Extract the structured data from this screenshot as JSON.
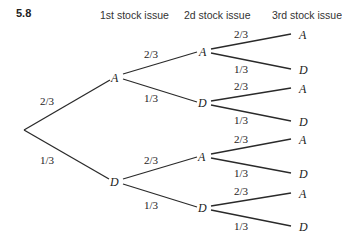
{
  "figure": {
    "problem_number": "5.8",
    "column_headers": [
      "1st stock issue",
      "2d stock issue",
      "3rd stock issue"
    ]
  },
  "tree": {
    "root": {
      "label": ""
    },
    "level1": [
      {
        "label": "A",
        "prob": "2/3"
      },
      {
        "label": "D",
        "prob": "1/3"
      }
    ],
    "level2": [
      {
        "label": "A",
        "prob": "2/3",
        "parent": 0
      },
      {
        "label": "D",
        "prob": "1/3",
        "parent": 0
      },
      {
        "label": "A",
        "prob": "2/3",
        "parent": 1
      },
      {
        "label": "D",
        "prob": "1/3",
        "parent": 1
      }
    ],
    "level3": [
      {
        "label": "A",
        "prob": "2/3",
        "parent": 0
      },
      {
        "label": "D",
        "prob": "1/3",
        "parent": 0
      },
      {
        "label": "A",
        "prob": "2/3",
        "parent": 1
      },
      {
        "label": "D",
        "prob": "1/3",
        "parent": 1
      },
      {
        "label": "A",
        "prob": "2/3",
        "parent": 2
      },
      {
        "label": "D",
        "prob": "1/3",
        "parent": 2
      },
      {
        "label": "A",
        "prob": "2/3",
        "parent": 3
      },
      {
        "label": "D",
        "prob": "1/3",
        "parent": 3
      }
    ]
  }
}
